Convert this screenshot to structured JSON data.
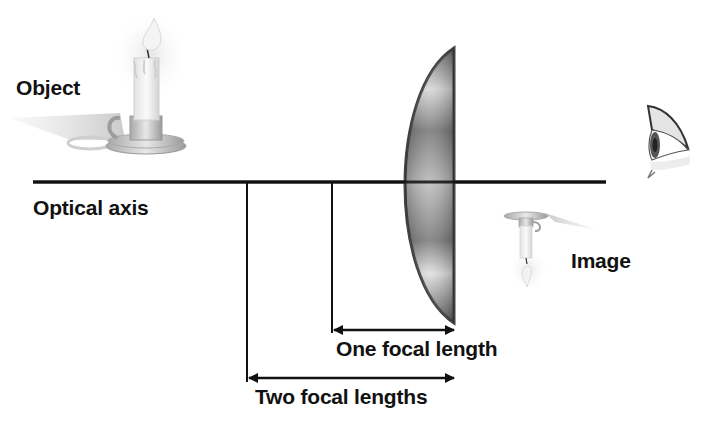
{
  "diagram": {
    "type": "optics-converging-lens",
    "labels": {
      "object": "Object",
      "optical_axis": "Optical axis",
      "image": "Image",
      "one_focal_length": "One focal length",
      "two_focal_lengths": "Two focal lengths"
    },
    "elements": [
      {
        "id": "object",
        "icon": "candle-icon",
        "orientation": "upright"
      },
      {
        "id": "lens",
        "icon": "plano-convex-lens-icon"
      },
      {
        "id": "image",
        "icon": "inverted-candle-icon",
        "orientation": "inverted"
      },
      {
        "id": "eye",
        "icon": "eye-icon"
      }
    ],
    "colors": {
      "line": "#111111",
      "lens_edge": "#444444",
      "background": "#ffffff"
    }
  }
}
